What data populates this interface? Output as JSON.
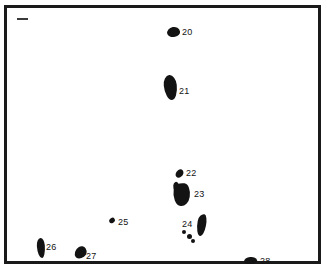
{
  "figure": {
    "type": "map-plate",
    "background_color": "#ffffff",
    "frame_color": "#1a1a1a",
    "feature_color": "#131313",
    "corner_tick": "scale-tick-mark"
  },
  "features": [
    {
      "id": "20",
      "label": "20",
      "shape": "oval",
      "name": "island-20"
    },
    {
      "id": "21",
      "label": "21",
      "shape": "elongated-oval",
      "name": "island-21"
    },
    {
      "id": "22",
      "label": "22",
      "shape": "small-sliver",
      "name": "island-22"
    },
    {
      "id": "23",
      "label": "23",
      "shape": "teardrop",
      "name": "island-23"
    },
    {
      "id": "24",
      "label": "24",
      "shape": "dot-cluster",
      "name": "island-24"
    },
    {
      "id": "25",
      "label": "25",
      "shape": "dot",
      "name": "island-25"
    },
    {
      "id": "26",
      "label": "26",
      "shape": "vertical-elongated",
      "name": "island-26"
    },
    {
      "id": "27",
      "label": "27",
      "shape": "comma",
      "name": "island-27"
    },
    {
      "id": "28",
      "label": "28",
      "shape": "oval",
      "name": "island-28"
    }
  ]
}
